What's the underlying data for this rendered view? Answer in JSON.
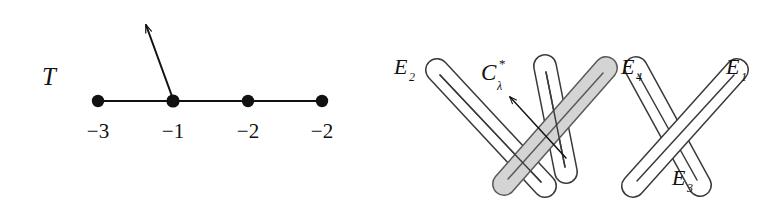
{
  "figure": {
    "background_color": "#ffffff",
    "ink_color": "#111111",
    "shaded_fill_color": "#d4d4d4",
    "shaded_stroke_color": "#5a5a5a"
  },
  "left_diagram": {
    "name": "weighted-graph-T",
    "title_label": "T",
    "vertices": [
      {
        "id": "v1",
        "label": "−3",
        "cx": 98,
        "cy": 101
      },
      {
        "id": "v2",
        "label": "−1",
        "cx": 173,
        "cy": 101
      },
      {
        "id": "v3",
        "label": "−2",
        "cx": 248,
        "cy": 101
      },
      {
        "id": "v4",
        "label": "−2",
        "cx": 322,
        "cy": 101
      }
    ],
    "edges": [
      {
        "from": "v1",
        "to": "v2"
      },
      {
        "from": "v2",
        "to": "v3"
      },
      {
        "from": "v3",
        "to": "v4"
      }
    ],
    "arrow": {
      "from_x": 173,
      "from_y": 101,
      "to_x": 145,
      "to_y": 23
    },
    "label_row_y": 133
  },
  "right_diagram": {
    "name": "exceptional-curves-configuration",
    "capsules": [
      {
        "id": "E2",
        "label": "E",
        "subscript": "2",
        "x1": 437,
        "y1": 70,
        "x2": 545,
        "y2": 186,
        "shaded": false,
        "label_x": 395,
        "label_y": 72
      },
      {
        "id": "E4",
        "label": "E",
        "subscript": "4",
        "x1": 606,
        "y1": 68,
        "x2": 504,
        "y2": 184,
        "shaded": true,
        "label_x": 621,
        "label_y": 72
      },
      {
        "id": "E1",
        "label": "E",
        "subscript": "1",
        "x1": 737,
        "y1": 70,
        "x2": 633,
        "y2": 186,
        "shaded": false,
        "label_x": 723,
        "label_y": 72
      },
      {
        "id": "E3",
        "label": "E",
        "subscript": "3",
        "x1": 636,
        "y1": 68,
        "x2": 700,
        "y2": 185,
        "shaded": false,
        "label_x": 672,
        "label_y": 183
      },
      {
        "id": "E5",
        "label": "",
        "subscript": "",
        "x1": 545,
        "y1": 66,
        "x2": 566,
        "y2": 172,
        "shaded": false,
        "label_x": 0,
        "label_y": 0
      }
    ],
    "curve_label": {
      "base": "C",
      "superscript": "*",
      "subscript": "λ",
      "x": 481,
      "y": 78
    },
    "curve_arrow": {
      "from_x": 566,
      "from_y": 158,
      "to_x": 509,
      "to_y": 96
    }
  }
}
